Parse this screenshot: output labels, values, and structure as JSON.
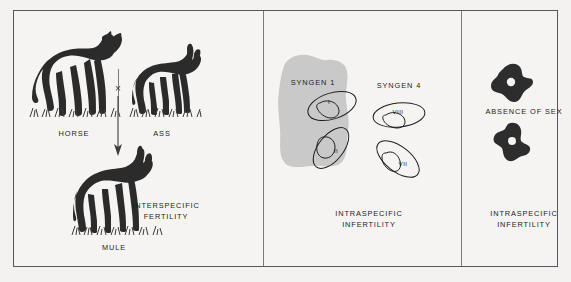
{
  "figure": {
    "background_color": "#f3f2f0",
    "frame_color": "#55585c",
    "ink_color": "#2b2b2b",
    "gray_blob_color": "#c8c8c8"
  },
  "panels": {
    "cross": {
      "parent_left": {
        "label": "HORSE",
        "icon": "horse-silhouette"
      },
      "parent_right": {
        "label": "ASS",
        "icon": "ass-silhouette"
      },
      "cross_symbol": "×",
      "offspring": {
        "label": "MULE",
        "icon": "mule-silhouette"
      },
      "outcome": "INTERSPECIFIC\nFERTILITY"
    },
    "syngen": {
      "group_left": {
        "label": "SYNGEN 1",
        "cells": [
          {
            "name": "I",
            "icon": "paramecium-cell"
          },
          {
            "name": "II",
            "icon": "paramecium-cell"
          }
        ]
      },
      "group_right": {
        "label": "SYNGEN 4",
        "cells": [
          {
            "name": "VIII",
            "icon": "paramecium-cell"
          },
          {
            "name": "VII",
            "icon": "paramecium-cell"
          }
        ]
      },
      "outcome": "INTRASPECIFIC\nINFERTILITY"
    },
    "asexual": {
      "label": "ABSENCE OF SEX",
      "cells": [
        {
          "icon": "amoeba-silhouette"
        },
        {
          "icon": "amoeba-silhouette"
        }
      ],
      "outcome": "INTRASPECIFIC\nINFERTILITY"
    }
  }
}
